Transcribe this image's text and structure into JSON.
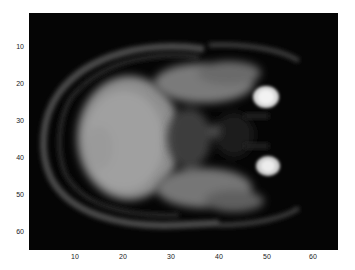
{
  "figure": {
    "type": "image",
    "colormap": "gray",
    "image_size": [
      64,
      64
    ],
    "x_ticks": [
      "10",
      "20",
      "30",
      "40",
      "50",
      "60"
    ],
    "y_ticks": [
      "10",
      "20",
      "30",
      "40",
      "50",
      "60"
    ],
    "xlim": [
      0.5,
      64.5
    ],
    "ylim": [
      0.5,
      64.5
    ],
    "background_color": "#050505"
  }
}
